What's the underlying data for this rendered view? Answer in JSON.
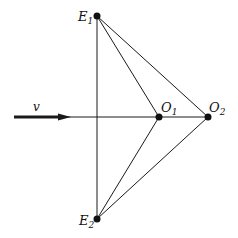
{
  "diagram": {
    "background": "#ffffff",
    "stroke_color": "#1a1a1a",
    "points": {
      "E1": {
        "label_main": "E",
        "label_sub": "1",
        "x": 97,
        "y": 16
      },
      "E2": {
        "label_main": "E",
        "label_sub": "2",
        "x": 97,
        "y": 219
      },
      "O1": {
        "label_main": "O",
        "label_sub": "1",
        "x": 159,
        "y": 117
      },
      "O2": {
        "label_main": "O",
        "label_sub": "2",
        "x": 208,
        "y": 117
      }
    },
    "velocity": {
      "label": "v"
    },
    "segments": [
      [
        "E1",
        "E2"
      ],
      [
        "E1",
        "O1"
      ],
      [
        "E1",
        "O2"
      ],
      [
        "E2",
        "O1"
      ],
      [
        "E2",
        "O2"
      ],
      [
        "arrow_tip",
        "O2"
      ]
    ]
  }
}
